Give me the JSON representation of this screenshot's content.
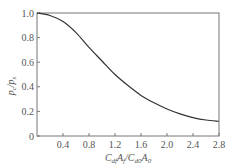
{
  "chart_data": {
    "type": "line",
    "title": "",
    "xlabel": "C_df A_f / C_d0 A_0",
    "ylabel": "p_c / p_s",
    "xlim": [
      0,
      2.8
    ],
    "ylim": [
      0,
      1.0
    ],
    "x_ticks": [
      "0.4",
      "0.8",
      "1.2",
      "1.6",
      "2.0",
      "2.4",
      "2.8"
    ],
    "y_ticks": [
      "0",
      "0.2",
      "0.4",
      "0.6",
      "0.8",
      "1.0"
    ],
    "grid": false,
    "legend": null,
    "series": [
      {
        "name": "p_c/p_s",
        "x": [
          0,
          0.2,
          0.4,
          0.6,
          0.8,
          1.0,
          1.2,
          1.4,
          1.6,
          1.8,
          2.0,
          2.2,
          2.4,
          2.6,
          2.8
        ],
        "values": [
          1.0,
          0.98,
          0.93,
          0.84,
          0.72,
          0.61,
          0.5,
          0.41,
          0.33,
          0.27,
          0.22,
          0.18,
          0.15,
          0.13,
          0.12
        ]
      }
    ]
  },
  "labels": {
    "ylabel_main": "p",
    "ylabel_sub1": "c",
    "ylabel_slash": "/",
    "ylabel_sub2": "s",
    "xlabel": "C",
    "xlabel_parts": [
      "C",
      "df",
      "A",
      "f",
      "/C",
      "d0",
      "A",
      "0"
    ]
  }
}
